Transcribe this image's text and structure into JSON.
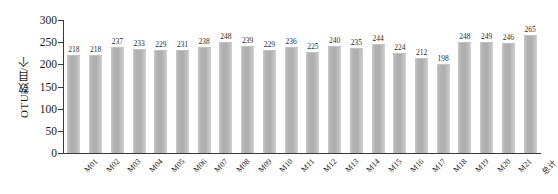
{
  "chart_data": {
    "type": "bar",
    "title": "",
    "subtitle": "",
    "xlabel": "",
    "ylabel": "OTU数目/个",
    "ylim": [
      0,
      300
    ],
    "yticks": [
      0,
      50,
      100,
      150,
      200,
      250,
      300
    ],
    "grid": false,
    "legend": null,
    "bar_color": "#b2b2b2",
    "axis_color": "#3a3a3a",
    "data_labels": true,
    "categories": [
      "M01",
      "M02",
      "M03",
      "M04",
      "M05",
      "M06",
      "M07",
      "M08",
      "M09",
      "M10",
      "M11",
      "M12",
      "M13",
      "M14",
      "M15",
      "M16",
      "M17",
      "M18",
      "M19",
      "M20",
      "M21",
      "总计"
    ],
    "values": [
      218,
      218,
      237,
      233,
      229,
      231,
      238,
      248,
      239,
      229,
      236,
      225,
      240,
      235,
      244,
      224,
      212,
      198,
      248,
      249,
      246,
      265
    ]
  }
}
